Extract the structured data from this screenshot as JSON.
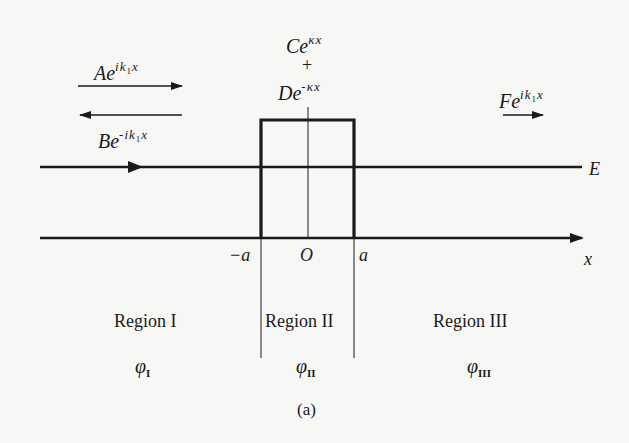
{
  "figure": {
    "caption": "(a)",
    "colors": {
      "ink": "#1a1a1a",
      "paper": "#f7f7f5"
    }
  },
  "waves": {
    "incident": {
      "coef": "A",
      "base": "e",
      "exp_pre": "ik",
      "exp_sub": "1",
      "exp_post": "x",
      "direction": "right"
    },
    "reflected": {
      "coef": "B",
      "base": "e",
      "exp_pre": "-ik",
      "exp_sub": "1",
      "exp_post": "x",
      "direction": "left"
    },
    "inside_growing": {
      "coef": "C",
      "base": "e",
      "exp": "κx"
    },
    "plus": "+",
    "inside_decaying": {
      "coef": "D",
      "base": "e",
      "exp": "-κx"
    },
    "transmitted": {
      "coef": "F",
      "base": "e",
      "exp_pre": "ik",
      "exp_sub": "1",
      "exp_post": "x",
      "direction": "right"
    }
  },
  "axis": {
    "x_label": "x",
    "energy_label": "E",
    "ticks": {
      "left": "−a",
      "origin": "O",
      "right": "a"
    }
  },
  "regions": [
    {
      "name": "Region I",
      "phi": "φ",
      "phi_sub": "I"
    },
    {
      "name": "Region II",
      "phi": "φ",
      "phi_sub": "II"
    },
    {
      "name": "Region III",
      "phi": "φ",
      "phi_sub": "III"
    }
  ]
}
